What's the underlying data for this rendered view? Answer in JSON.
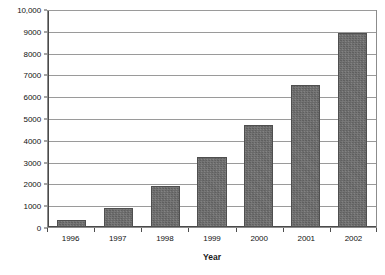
{
  "chart_data": {
    "type": "bar",
    "title": "",
    "subtitle": "",
    "xlabel": "Year",
    "ylabel": "$ Millions",
    "categories": [
      "1996",
      "1997",
      "1998",
      "1999",
      "2000",
      "2001",
      "2002"
    ],
    "values": [
      300,
      870,
      1900,
      3200,
      4700,
      6500,
      8900
    ],
    "series": [
      {
        "name": "",
        "values": [
          300,
          870,
          1900,
          3200,
          4700,
          6500,
          8900
        ]
      }
    ],
    "ylim": [
      0,
      10000
    ],
    "ytick_values": [
      0,
      1000,
      2000,
      3000,
      4000,
      5000,
      6000,
      7000,
      8000,
      9000,
      10000
    ],
    "ytick_labels": [
      "0",
      "1000",
      "2000",
      "3000",
      "4000",
      "5000",
      "6000",
      "7000",
      "8000",
      "9000",
      "10,000"
    ],
    "grid": "horizontal",
    "legend": "none",
    "bar_color": "#6f6f6f",
    "bar_border_color": "#4f4f4f",
    "gridline_color": "#9a9a9a",
    "axis_color": "#4a4a4a",
    "plot_background": "#ffffff",
    "annotations": []
  }
}
